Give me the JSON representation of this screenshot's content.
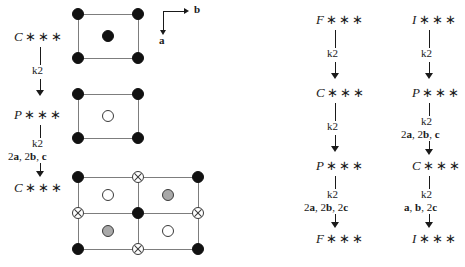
{
  "figure": {
    "axes": {
      "b_label": "b",
      "a_label": "a"
    },
    "symbols": {
      "filled": "filled-circle",
      "open": "open-circle",
      "grey": "grey-circle",
      "cross": "crossed-circle"
    }
  },
  "left_chain": {
    "nodes": [
      {
        "letter": "C",
        "stars": "∗∗∗"
      },
      {
        "letter": "P",
        "stars": "∗∗∗"
      },
      {
        "letter": "C",
        "stars": "∗∗∗"
      }
    ],
    "arrows": [
      {
        "index": "k2",
        "basis": ""
      },
      {
        "index": "k2",
        "basis_parts": [
          "2",
          "a",
          ", 2",
          "b",
          ", ",
          "c"
        ]
      }
    ],
    "arrow_labels": [
      {
        "index": "k2"
      },
      {
        "index": "k2"
      }
    ]
  },
  "left_basis_1": {
    "index": "k2"
  },
  "left_basis_2": {
    "index": "k2",
    "basis": "2a, 2b, c"
  },
  "middle_chain": {
    "nodes": [
      {
        "letter": "F",
        "stars": "∗∗∗"
      },
      {
        "letter": "C",
        "stars": "∗∗∗"
      },
      {
        "letter": "P",
        "stars": "∗∗∗"
      },
      {
        "letter": "F",
        "stars": "∗∗∗"
      }
    ],
    "steps": [
      {
        "index": "k2",
        "basis": ""
      },
      {
        "index": "k2",
        "basis": ""
      },
      {
        "index": "k2",
        "basis": "2a, 2b, 2c"
      }
    ]
  },
  "right_chain": {
    "nodes": [
      {
        "letter": "I",
        "stars": "∗∗∗"
      },
      {
        "letter": "P",
        "stars": "∗∗∗"
      },
      {
        "letter": "C",
        "stars": "∗∗∗"
      },
      {
        "letter": "I",
        "stars": "∗∗∗"
      }
    ],
    "steps": [
      {
        "index": "k2",
        "basis": ""
      },
      {
        "index": "k2",
        "basis": "2a, 2b, c"
      },
      {
        "index": "k2",
        "basis": "a, b, 2c"
      }
    ]
  },
  "cells": {
    "cell1": {
      "name": "C-centred-cell",
      "caption": "C"
    },
    "cell2": {
      "name": "P-cell",
      "caption": "P"
    },
    "cell3": {
      "name": "C-centred-supercell",
      "caption": "C"
    }
  }
}
